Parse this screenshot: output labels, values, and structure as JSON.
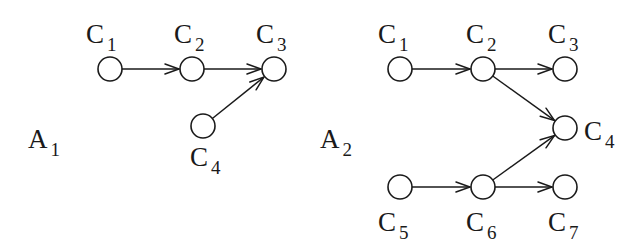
{
  "figure": {
    "graphs": [
      {
        "id": "A1",
        "label": {
          "main": "A",
          "sub": "1",
          "x": 28,
          "y": 148
        },
        "nodes": [
          {
            "id": "C1",
            "main": "C",
            "sub": "1",
            "cx": 110,
            "cy": 69,
            "lx": 86,
            "ly": 43
          },
          {
            "id": "C2",
            "main": "C",
            "sub": "2",
            "cx": 192,
            "cy": 69,
            "lx": 174,
            "ly": 43
          },
          {
            "id": "C3",
            "main": "C",
            "sub": "3",
            "cx": 274,
            "cy": 69,
            "lx": 256,
            "ly": 43
          },
          {
            "id": "C4",
            "main": "C",
            "sub": "4",
            "cx": 203,
            "cy": 126,
            "lx": 190,
            "ly": 166
          }
        ],
        "edges": [
          {
            "from": "C1",
            "to": "C2"
          },
          {
            "from": "C2",
            "to": "C3"
          },
          {
            "from": "C4",
            "to": "C3"
          }
        ]
      },
      {
        "id": "A2",
        "label": {
          "main": "A",
          "sub": "2",
          "x": 320,
          "y": 148
        },
        "nodes": [
          {
            "id": "C1",
            "main": "C",
            "sub": "1",
            "cx": 400,
            "cy": 69,
            "lx": 378,
            "ly": 43
          },
          {
            "id": "C2",
            "main": "C",
            "sub": "2",
            "cx": 483,
            "cy": 69,
            "lx": 466,
            "ly": 43
          },
          {
            "id": "C3",
            "main": "C",
            "sub": "3",
            "cx": 565,
            "cy": 69,
            "lx": 548,
            "ly": 43
          },
          {
            "id": "C4",
            "main": "C",
            "sub": "4",
            "cx": 565,
            "cy": 128,
            "lx": 584,
            "ly": 140
          },
          {
            "id": "C5",
            "main": "C",
            "sub": "5",
            "cx": 400,
            "cy": 187,
            "lx": 378,
            "ly": 231
          },
          {
            "id": "C6",
            "main": "C",
            "sub": "6",
            "cx": 483,
            "cy": 187,
            "lx": 466,
            "ly": 231
          },
          {
            "id": "C7",
            "main": "C",
            "sub": "7",
            "cx": 565,
            "cy": 187,
            "lx": 548,
            "ly": 231
          }
        ],
        "edges": [
          {
            "from": "C1",
            "to": "C2"
          },
          {
            "from": "C2",
            "to": "C3"
          },
          {
            "from": "C2",
            "to": "C4"
          },
          {
            "from": "C5",
            "to": "C6"
          },
          {
            "from": "C6",
            "to": "C4"
          },
          {
            "from": "C6",
            "to": "C7"
          }
        ]
      }
    ],
    "style": {
      "node_radius": 12,
      "ink": "#1a1a1a",
      "background": "#ffffff"
    }
  }
}
